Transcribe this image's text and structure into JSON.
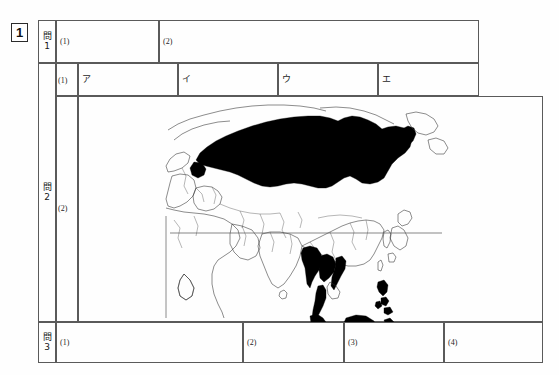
{
  "sheet": {
    "problem_number": "1",
    "sections": [
      {
        "id": "mon1",
        "kanji": "問",
        "number": "1",
        "items": [
          {
            "label": "(1)",
            "value": ""
          },
          {
            "label": "(2)",
            "value": ""
          }
        ]
      },
      {
        "id": "mon2",
        "kanji": "問",
        "number": "2",
        "items": [
          {
            "label": "(1)",
            "value": ""
          },
          {
            "label": "(2)",
            "value": ""
          }
        ],
        "choices": [
          {
            "label": "ア",
            "value": ""
          },
          {
            "label": "イ",
            "value": ""
          },
          {
            "label": "ウ",
            "value": ""
          },
          {
            "label": "エ",
            "value": ""
          }
        ]
      },
      {
        "id": "mon3",
        "kanji": "問",
        "number": "3",
        "items": [
          {
            "label": "(1)",
            "value": ""
          },
          {
            "label": "(2)",
            "value": ""
          },
          {
            "label": "(3)",
            "value": ""
          },
          {
            "label": "(4)",
            "value": ""
          }
        ]
      }
    ],
    "map": {
      "name": "eurasia-oceania-outline-map",
      "equator_line": true,
      "shaded_regions": [
        "Russia",
        "Myanmar",
        "Thailand",
        "Malaysia",
        "Indonesia",
        "Philippines",
        "Papua New Guinea",
        "Brunei"
      ],
      "outlined_regions": [
        "Europe",
        "Middle East",
        "India",
        "China",
        "Mongolia",
        "Japan",
        "Korea",
        "Australia",
        "New Zealand",
        "Madagascar",
        "Africa (partial)",
        "Alaska (partial)"
      ]
    },
    "colors": {
      "ink": "#1a1a1a",
      "rule": "#5a5a5a",
      "fill": "#000000",
      "paper": "#fefefe"
    }
  }
}
